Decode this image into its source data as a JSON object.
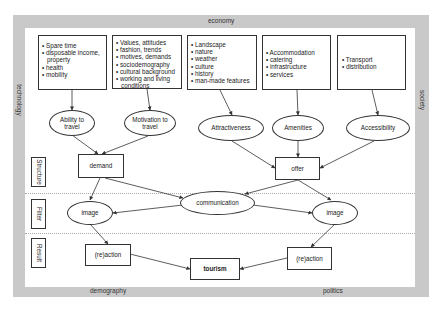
{
  "frame": {
    "top": "economy",
    "bottom_left": "demography",
    "bottom_right": "politics",
    "left": "technology",
    "right": "society"
  },
  "rows": {
    "structure": "Structure",
    "filter": "Filter",
    "result": "Result"
  },
  "boxes": {
    "b1": [
      "Spare time",
      "disposable income, property",
      "health",
      "mobility"
    ],
    "b2": [
      "Values, attitudes",
      "fashion, trends",
      "motives, demands",
      "sociodemography",
      "cultural background",
      "working and living conditions"
    ],
    "b3": [
      "Landscape",
      "nature",
      "weather",
      "culture",
      "history",
      "man-made features"
    ],
    "b4": [
      "Accommodation",
      "catering",
      "infrastructure",
      "services"
    ],
    "b5": [
      "Transport",
      "distribution"
    ]
  },
  "ellipses": {
    "ability": "Ability to travel",
    "motivation": "Motivation to travel",
    "attractiveness": "Attractiveness",
    "amenities": "Amenities",
    "accessibility": "Accessibility",
    "image_left": "image",
    "communication": "communication",
    "image_right": "image"
  },
  "nodes": {
    "demand": "demand",
    "offer": "offer",
    "reaction_left": "(re)action",
    "tourism": "tourism",
    "reaction_right": "(re)action"
  },
  "colors": {
    "frame": "#c9c9c9",
    "line": "#333333"
  }
}
